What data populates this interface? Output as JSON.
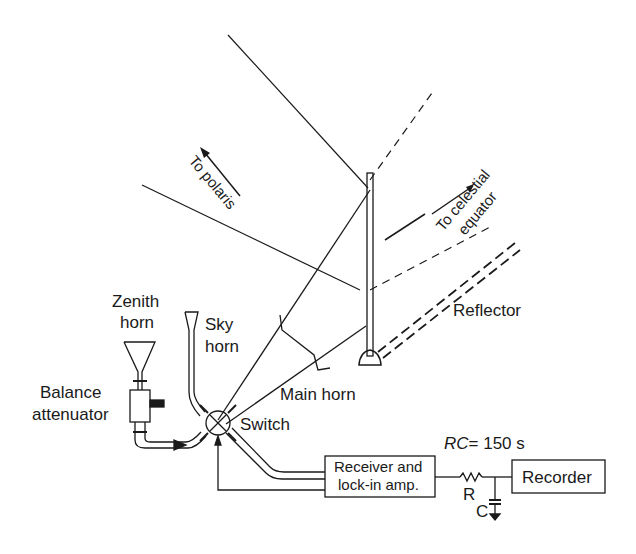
{
  "diagram": {
    "labels": {
      "to_polaris": "To polaris",
      "to_celestial_1": "To celestial",
      "to_celestial_2": "equator",
      "reflector": "Reflector",
      "zenith_horn_1": "Zenith",
      "zenith_horn_2": "horn",
      "sky_horn_1": "Sky",
      "sky_horn_2": "horn",
      "balance_1": "Balance",
      "balance_2": "attenuator",
      "main_horn": "Main horn",
      "switch": "Switch",
      "rc_value": "= 150 s",
      "rc_prefix": "RC",
      "receiver_1": "Receiver and",
      "receiver_2": "lock-in amp.",
      "recorder": "Recorder",
      "resistor": "R",
      "capacitor": "C"
    },
    "components": [
      {
        "id": "zenith-horn",
        "type": "horn"
      },
      {
        "id": "sky-horn",
        "type": "horn"
      },
      {
        "id": "main-horn",
        "type": "horn"
      },
      {
        "id": "balance-attenuator",
        "type": "attenuator"
      },
      {
        "id": "switch",
        "type": "waveguide-switch"
      },
      {
        "id": "reflector",
        "type": "flat-reflector"
      },
      {
        "id": "receiver",
        "type": "receiver-lock-in-amplifier"
      },
      {
        "id": "rc-filter",
        "type": "low-pass",
        "time_constant": "150 s"
      },
      {
        "id": "recorder",
        "type": "recorder"
      }
    ],
    "colors": {
      "ink": "#1a1a1a",
      "background": "#ffffff"
    }
  }
}
